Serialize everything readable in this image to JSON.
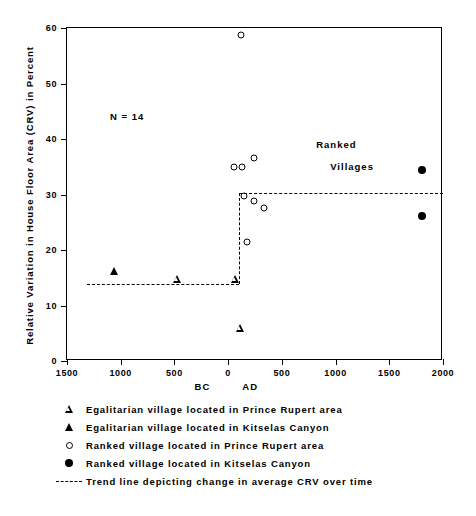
{
  "chart_data": {
    "type": "scatter",
    "title": "",
    "xlabel": "",
    "ylabel": "Relative Variation in House Floor Area (CRV) in Percent",
    "xlim": [
      -1500,
      2000
    ],
    "ylim": [
      0,
      60
    ],
    "grid": false,
    "legend_position": "below-plot",
    "annotations": [
      {
        "text": "N = 14",
        "x": -1100,
        "y": 44
      },
      {
        "text": "Ranked",
        "x": 820,
        "y": 39
      },
      {
        "text": "Villages",
        "x": 950,
        "y": 35
      }
    ],
    "x_ticks": [
      {
        "value": -1500,
        "label": "1500"
      },
      {
        "value": -1000,
        "label": "1000"
      },
      {
        "value": -500,
        "label": "500"
      },
      {
        "value": 0,
        "label": "0"
      },
      {
        "value": 500,
        "label": "500"
      },
      {
        "value": 1000,
        "label": "1000"
      },
      {
        "value": 1500,
        "label": "1500"
      },
      {
        "value": 2000,
        "label": "2000"
      }
    ],
    "y_ticks": [
      {
        "value": 0,
        "label": "0"
      },
      {
        "value": 10,
        "label": "10"
      },
      {
        "value": 20,
        "label": "20"
      },
      {
        "value": 30,
        "label": "30"
      },
      {
        "value": 40,
        "label": "40"
      },
      {
        "value": 50,
        "label": "50"
      },
      {
        "value": 60,
        "label": "60"
      }
    ],
    "era_labels": [
      {
        "text": "BC",
        "x": -230
      },
      {
        "text": "AD",
        "x": 215
      }
    ],
    "series": [
      {
        "name": "Egalitarian village located in Prince Rupert area",
        "marker": "open-triangle",
        "points": [
          {
            "x": -480,
            "y": 14.8
          },
          {
            "x": 60,
            "y": 16.2
          },
          {
            "x": 110,
            "y": 8.9
          }
        ]
      },
      {
        "name": "Egalitarian village located in Kitselas Canyon",
        "marker": "filled-triangle",
        "points": [
          {
            "x": -1060,
            "y": 16.2
          }
        ]
      },
      {
        "name": "Ranked village located in Prince Rupert area",
        "marker": "open-circle",
        "points": [
          {
            "x": 120,
            "y": 58.8
          },
          {
            "x": 55,
            "y": 35.0
          },
          {
            "x": 130,
            "y": 35.0
          },
          {
            "x": 245,
            "y": 36.5
          },
          {
            "x": 150,
            "y": 29.8
          },
          {
            "x": 245,
            "y": 28.9
          },
          {
            "x": 330,
            "y": 27.5
          },
          {
            "x": 175,
            "y": 21.4
          }
        ]
      },
      {
        "name": "Ranked village located in Kitselas Canyon",
        "marker": "filled-circle",
        "points": [
          {
            "x": 1800,
            "y": 34.4
          },
          {
            "x": 1800,
            "y": 26.2
          }
        ]
      }
    ],
    "trend_line": {
      "name": "Trend line depicting change in average CRV over time",
      "style": "dashed",
      "segments": [
        {
          "x1": -1310,
          "y1": 13.9,
          "x2": 105,
          "y2": 13.9
        },
        {
          "x1": 105,
          "y1": 13.9,
          "x2": 105,
          "y2": 30.3
        },
        {
          "x1": 105,
          "y1": 30.3,
          "x2": 2000,
          "y2": 30.3
        }
      ]
    }
  },
  "legend": {
    "items": [
      {
        "symbol": "open-triangle",
        "label": "Egalitarian village located in Prince Rupert area"
      },
      {
        "symbol": "filled-triangle",
        "label": "Egalitarian village located in Kitselas Canyon"
      },
      {
        "symbol": "open-circle",
        "label": "Ranked village located in Prince Rupert area"
      },
      {
        "symbol": "filled-circle",
        "label": "Ranked village located in Kitselas Canyon"
      },
      {
        "symbol": "dashed-line",
        "label": "Trend line depicting change in average CRV over time"
      }
    ]
  },
  "colors": {
    "ink": "#000000",
    "paper": "#ffffff"
  }
}
